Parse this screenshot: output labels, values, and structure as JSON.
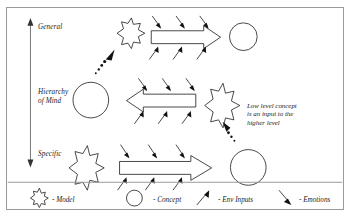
{
  "diagram": {
    "title": "Hierarchy of Mind",
    "axis": {
      "top_label": "General",
      "middle_label": "Hierarchy\nof Mind",
      "bottom_label": "Specific"
    },
    "annotation": "Low level concept\nis an input to the\nhigher level",
    "levels": [
      {
        "name": "general-level",
        "model": "Model",
        "process": "process-arrow-right",
        "concept": "Concept",
        "env_inputs": 3,
        "emotions": 3
      },
      {
        "name": "intermediate-level",
        "model": "Model",
        "process": "process-arrow-left",
        "concept": "Concept",
        "env_inputs": 3,
        "emotions": 3
      },
      {
        "name": "specific-level",
        "model": "Model",
        "process": "process-arrow-right",
        "concept": "Concept",
        "env_inputs": 3,
        "emotions": 3
      }
    ],
    "legend": [
      {
        "icon": "star-icon",
        "label": "- Model"
      },
      {
        "icon": "circle-icon",
        "label": "- Concept"
      },
      {
        "icon": "up-arrow-icon",
        "label": "- Env Inputs"
      },
      {
        "icon": "down-arrow-icon",
        "label": "- Emotions"
      }
    ],
    "colors": {
      "ink": "#1a1a1a",
      "frame": "#9a9a9a",
      "fill": "#ffffff"
    }
  }
}
